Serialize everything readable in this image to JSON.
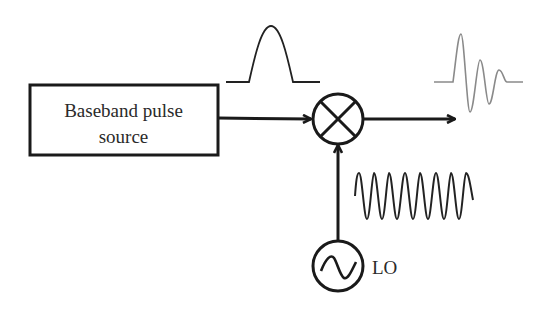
{
  "diagram": {
    "type": "block-diagram",
    "blocks": [
      {
        "id": "source",
        "label_line1": "Baseband pulse",
        "label_line2": "source"
      },
      {
        "id": "mixer",
        "symbol": "multiplier (circle with X)"
      },
      {
        "id": "lo",
        "symbol": "sine source",
        "label": "LO"
      }
    ],
    "signals": {
      "baseband": "single Gaussian-like pulse",
      "lo": "continuous sinusoid",
      "output": "modulated RF pulse (damped oscillation)"
    },
    "connections": [
      {
        "from": "source",
        "to": "mixer"
      },
      {
        "from": "lo",
        "to": "mixer"
      },
      {
        "from": "mixer",
        "to": "output"
      }
    ],
    "colors": {
      "stroke": "#1a1a1a",
      "output_wave": "#8a8a8a"
    }
  }
}
